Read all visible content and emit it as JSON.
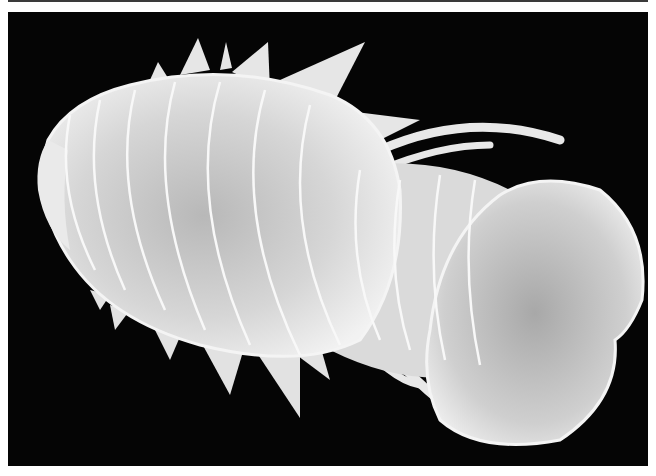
{
  "image": {
    "subject": "scanning electron micrograph of a segmented isopod crustacean",
    "view": "dorsal",
    "background_color": "#050505",
    "border_color": "#ffffff",
    "body_color": "#e4e4e4",
    "shadow_color": "#9a9a9a",
    "segments": 11,
    "has_text": false
  }
}
